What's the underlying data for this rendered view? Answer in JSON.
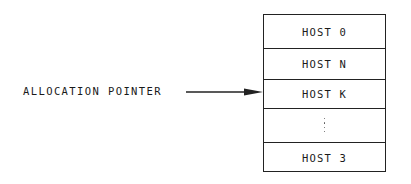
{
  "diagram": {
    "pointer_label": "ALLOCATION POINTER",
    "pointer_target_index": 2,
    "stack": {
      "cells": [
        {
          "label": "HOST 0",
          "top": 0,
          "height": 33
        },
        {
          "label": "HOST N",
          "top": 33,
          "height": 31
        },
        {
          "label": "HOST K",
          "top": 64,
          "height": 29
        },
        {
          "label": "",
          "ellipsis": true,
          "top": 93,
          "height": 34
        },
        {
          "label": "HOST 3",
          "top": 127,
          "height": 31
        }
      ]
    },
    "colors": {
      "line": "#222222",
      "text": "#1a1a1a",
      "background": "#ffffff"
    }
  }
}
